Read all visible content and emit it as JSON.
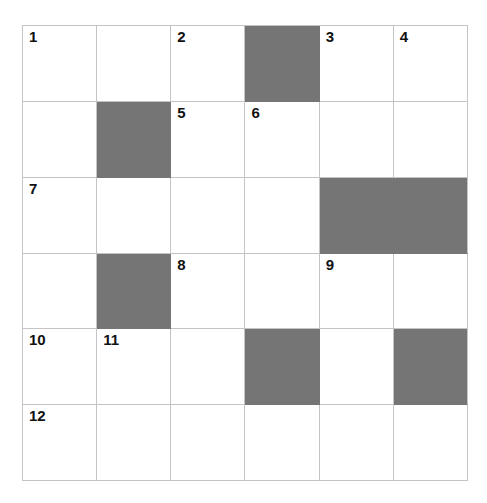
{
  "puzzle": {
    "title": "Crossword Grid",
    "rows": 6,
    "columns": 6,
    "cell_width_px": 74,
    "cell_height_px": 76,
    "grid_origin": {
      "x": 22,
      "y": 25
    },
    "colors": {
      "background": "#ffffff",
      "cell_fill": "#ffffff",
      "blocked_fill": "#757575",
      "grid_line": "#c4c4c4",
      "number_text": "#111111"
    },
    "cells": [
      [
        {
          "row": 1,
          "col": 1,
          "blocked": false,
          "number": "1",
          "letter": ""
        },
        {
          "row": 1,
          "col": 2,
          "blocked": false,
          "number": "",
          "letter": ""
        },
        {
          "row": 1,
          "col": 3,
          "blocked": false,
          "number": "2",
          "letter": ""
        },
        {
          "row": 1,
          "col": 4,
          "blocked": true,
          "number": "",
          "letter": ""
        },
        {
          "row": 1,
          "col": 5,
          "blocked": false,
          "number": "3",
          "letter": ""
        },
        {
          "row": 1,
          "col": 6,
          "blocked": false,
          "number": "4",
          "letter": ""
        }
      ],
      [
        {
          "row": 2,
          "col": 1,
          "blocked": false,
          "number": "",
          "letter": ""
        },
        {
          "row": 2,
          "col": 2,
          "blocked": true,
          "number": "",
          "letter": ""
        },
        {
          "row": 2,
          "col": 3,
          "blocked": false,
          "number": "5",
          "letter": ""
        },
        {
          "row": 2,
          "col": 4,
          "blocked": false,
          "number": "6",
          "letter": ""
        },
        {
          "row": 2,
          "col": 5,
          "blocked": false,
          "number": "",
          "letter": ""
        },
        {
          "row": 2,
          "col": 6,
          "blocked": false,
          "number": "",
          "letter": ""
        }
      ],
      [
        {
          "row": 3,
          "col": 1,
          "blocked": false,
          "number": "7",
          "letter": ""
        },
        {
          "row": 3,
          "col": 2,
          "blocked": false,
          "number": "",
          "letter": ""
        },
        {
          "row": 3,
          "col": 3,
          "blocked": false,
          "number": "",
          "letter": ""
        },
        {
          "row": 3,
          "col": 4,
          "blocked": false,
          "number": "",
          "letter": ""
        },
        {
          "row": 3,
          "col": 5,
          "blocked": true,
          "number": "",
          "letter": ""
        },
        {
          "row": 3,
          "col": 6,
          "blocked": true,
          "number": "",
          "letter": ""
        }
      ],
      [
        {
          "row": 4,
          "col": 1,
          "blocked": false,
          "number": "",
          "letter": ""
        },
        {
          "row": 4,
          "col": 2,
          "blocked": true,
          "number": "",
          "letter": ""
        },
        {
          "row": 4,
          "col": 3,
          "blocked": false,
          "number": "8",
          "letter": ""
        },
        {
          "row": 4,
          "col": 4,
          "blocked": false,
          "number": "",
          "letter": ""
        },
        {
          "row": 4,
          "col": 5,
          "blocked": false,
          "number": "9",
          "letter": ""
        },
        {
          "row": 4,
          "col": 6,
          "blocked": false,
          "number": "",
          "letter": ""
        }
      ],
      [
        {
          "row": 5,
          "col": 1,
          "blocked": false,
          "number": "10",
          "letter": ""
        },
        {
          "row": 5,
          "col": 2,
          "blocked": false,
          "number": "11",
          "letter": ""
        },
        {
          "row": 5,
          "col": 3,
          "blocked": false,
          "number": "",
          "letter": ""
        },
        {
          "row": 5,
          "col": 4,
          "blocked": true,
          "number": "",
          "letter": ""
        },
        {
          "row": 5,
          "col": 5,
          "blocked": false,
          "number": "",
          "letter": ""
        },
        {
          "row": 5,
          "col": 6,
          "blocked": true,
          "number": "",
          "letter": ""
        }
      ],
      [
        {
          "row": 6,
          "col": 1,
          "blocked": false,
          "number": "12",
          "letter": ""
        },
        {
          "row": 6,
          "col": 2,
          "blocked": false,
          "number": "",
          "letter": ""
        },
        {
          "row": 6,
          "col": 3,
          "blocked": false,
          "number": "",
          "letter": ""
        },
        {
          "row": 6,
          "col": 4,
          "blocked": false,
          "number": "",
          "letter": ""
        },
        {
          "row": 6,
          "col": 5,
          "blocked": false,
          "number": "",
          "letter": ""
        },
        {
          "row": 6,
          "col": 6,
          "blocked": false,
          "number": "",
          "letter": ""
        }
      ]
    ]
  }
}
